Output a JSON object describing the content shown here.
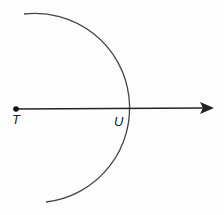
{
  "diagram": {
    "type": "geometry-construction",
    "points": [
      {
        "label": "T",
        "x": 16,
        "y": 109
      },
      {
        "label": "U",
        "x": 108,
        "y": 109
      }
    ],
    "ray": {
      "from": "T",
      "through": "U",
      "end": {
        "x": 213,
        "y": 108
      }
    },
    "arc": {
      "center": "T",
      "radius": 92,
      "start": {
        "x": 24,
        "y": 14
      },
      "end": {
        "x": 46,
        "y": 202
      }
    },
    "colors": {
      "stroke": "#222222",
      "arc": "#444444"
    }
  },
  "labels": {
    "t": "T",
    "u": "U"
  }
}
